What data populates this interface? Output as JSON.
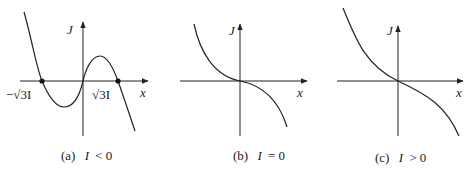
{
  "figure": {
    "panels": [
      {
        "id": "a",
        "caption_tag": "(a)",
        "caption_var": "I",
        "caption_rel": "< 0",
        "y_label": "J",
        "x_label": "x",
        "root_left_label": "−√3I",
        "root_right_label": "√3I",
        "curve": "cubic with three real roots: J = −x³ + 3Ix with I<0 sign convention; roots at −√3I, 0, √3I"
      },
      {
        "id": "b",
        "caption_tag": "(b)",
        "caption_var": "I",
        "caption_rel": "= 0",
        "y_label": "J",
        "x_label": "x",
        "curve": "J = −x³, inflection at origin"
      },
      {
        "id": "c",
        "caption_tag": "(c)",
        "caption_var": "I",
        "caption_rel": "> 0",
        "y_label": "J",
        "x_label": "x",
        "curve": "monotonically decreasing cubic through origin"
      }
    ]
  }
}
